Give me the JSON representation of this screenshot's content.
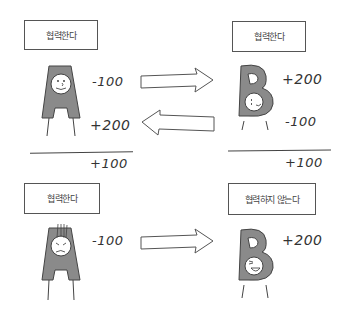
{
  "diagram": {
    "type": "payoff-illustration",
    "scenarios": [
      {
        "name": "both-cooperate",
        "player_a": {
          "letter": "A",
          "label": "협력한다",
          "payoffs": [
            "-100",
            "+200"
          ],
          "total": "+100",
          "expression": "smiling"
        },
        "player_b": {
          "letter": "B",
          "label": "협력한다",
          "payoffs": [
            "+200",
            "-100"
          ],
          "total": "+100",
          "expression": "smiling"
        },
        "arrows": [
          "A-to-B",
          "B-to-A"
        ]
      },
      {
        "name": "a-cooperates-b-defects",
        "player_a": {
          "letter": "A",
          "label": "협력한다",
          "payoffs": [
            "-100"
          ],
          "expression": "distressed"
        },
        "player_b": {
          "letter": "B",
          "label": "협력하지 않는다",
          "payoffs": [
            "+200"
          ],
          "expression": "laughing"
        },
        "arrows": [
          "A-to-B"
        ]
      }
    ],
    "colors": {
      "figure_fill": "#8a8a8a",
      "stroke": "#444444",
      "face": "#ffffff",
      "background": "#ffffff"
    }
  }
}
